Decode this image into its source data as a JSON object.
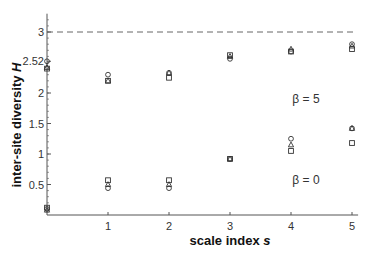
{
  "chart_data": {
    "type": "scatter",
    "title": "",
    "xlabel": "scale index s",
    "ylabel": "inter-site diversity H",
    "xlim": [
      0,
      5.1
    ],
    "ylim": [
      0,
      3.3
    ],
    "x_ticks": [
      "1",
      "2",
      "3",
      "4",
      "5"
    ],
    "y_ticks": [
      "0.5",
      "1",
      "1.5",
      "2",
      "2.52",
      "3"
    ],
    "reference_line": {
      "y": 3.0,
      "style": "dashed"
    },
    "grid": false,
    "legend": null,
    "annotations": [
      {
        "text": "β = 5",
        "x": 4.5,
        "y": 1.85
      },
      {
        "text": "β = 0",
        "x": 4.5,
        "y": 0.68
      }
    ],
    "x": [
      0,
      1,
      2,
      3,
      4,
      5
    ],
    "series": [
      {
        "name": "β=5 circle",
        "marker": "circle",
        "values": [
          2.52,
          2.3,
          2.33,
          2.56,
          2.68,
          2.8
        ]
      },
      {
        "name": "β=5 triangle",
        "marker": "triangle",
        "values": [
          2.42,
          2.2,
          2.33,
          2.6,
          2.72,
          2.77
        ]
      },
      {
        "name": "β=5 square",
        "marker": "square",
        "values": [
          2.4,
          2.2,
          2.25,
          2.62,
          2.68,
          2.72
        ]
      },
      {
        "name": "β=0 circle",
        "marker": "circle",
        "values": [
          0.1,
          0.44,
          0.44,
          0.92,
          1.25,
          1.42
        ]
      },
      {
        "name": "β=0 triangle",
        "marker": "triangle",
        "values": [
          0.08,
          0.5,
          0.5,
          0.92,
          1.15,
          1.42
        ]
      },
      {
        "name": "β=0 square",
        "marker": "square",
        "values": [
          0.12,
          0.57,
          0.57,
          0.92,
          1.05,
          1.18
        ]
      }
    ]
  },
  "labels": {
    "xlabel_text": "scale index ",
    "xlabel_var": "s",
    "ylabel_text": "inter-site diversity ",
    "ylabel_var": "H",
    "beta5": "β = 5",
    "beta0": "β = 0"
  },
  "colors": {
    "axis": "#555555",
    "marker": "#333333",
    "dashed": "#666666"
  }
}
